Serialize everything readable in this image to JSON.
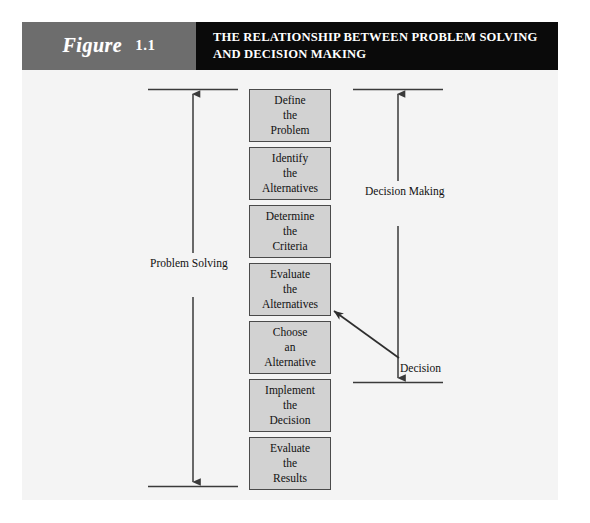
{
  "figure": {
    "label_word": "Figure",
    "number": "1.1",
    "title": "THE RELATIONSHIP BETWEEN PROBLEM SOLVING AND DECISION MAKING"
  },
  "colors": {
    "panel_background": "#f4f4f4",
    "label_box": "#6d6d6d",
    "title_box": "#0a0a0a",
    "step_box_fill": "#d2d2d2",
    "step_box_border": "#4a4a4a",
    "line": "#3a3a3a",
    "text": "#111111",
    "header_text": "#ffffff"
  },
  "diagram": {
    "type": "flowchart",
    "steps": [
      {
        "lines": [
          "Define",
          "the",
          "Problem"
        ]
      },
      {
        "lines": [
          "Identify",
          "the",
          "Alternatives"
        ]
      },
      {
        "lines": [
          "Determine",
          "the",
          "Criteria"
        ]
      },
      {
        "lines": [
          "Evaluate",
          "the",
          "Alternatives"
        ]
      },
      {
        "lines": [
          "Choose",
          "an",
          "Alternative"
        ]
      },
      {
        "lines": [
          "Implement",
          "the",
          "Decision"
        ]
      },
      {
        "lines": [
          "Evaluate",
          "the",
          "Results"
        ]
      }
    ],
    "brackets": [
      {
        "name": "problem-solving",
        "label_lines": [
          "Problem",
          "Solving"
        ],
        "spans_steps": [
          1,
          7
        ],
        "side": "left"
      },
      {
        "name": "decision-making",
        "label_lines": [
          "Decision",
          "Making"
        ],
        "spans_steps": [
          1,
          5
        ],
        "side": "right"
      }
    ],
    "annotation": {
      "name": "decision-callout",
      "label": "Decision",
      "points_to_step": 5
    }
  }
}
